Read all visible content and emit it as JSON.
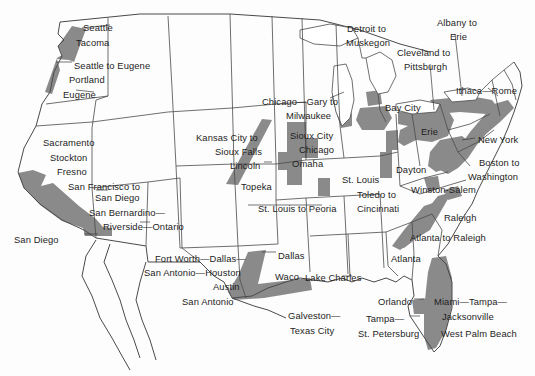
{
  "map": {
    "title": "United States megaregion corridors map",
    "colors": {
      "corridor_fill": "#8a8a8a",
      "state_border": "#4a4a4a",
      "background": "#fdfdfd",
      "label_text": "#1d1d1d"
    },
    "labels": [
      {
        "name": "label-seattle",
        "lines": [
          "Seattle"
        ],
        "x": 83,
        "y": 22,
        "align": "left"
      },
      {
        "name": "label-tacoma",
        "lines": [
          "Tacoma"
        ],
        "x": 76,
        "y": 37,
        "align": "left"
      },
      {
        "name": "label-seattle-to-eugene",
        "lines": [
          "Seattle to Eugene"
        ],
        "x": 74,
        "y": 60,
        "align": "left"
      },
      {
        "name": "label-portland",
        "lines": [
          "Portland"
        ],
        "x": 69,
        "y": 74,
        "align": "left"
      },
      {
        "name": "label-eugene",
        "lines": [
          "Eugene"
        ],
        "x": 63,
        "y": 89,
        "align": "left"
      },
      {
        "name": "label-sacramento",
        "lines": [
          "Sacramento"
        ],
        "x": 43,
        "y": 137,
        "align": "left"
      },
      {
        "name": "label-stockton",
        "lines": [
          "Stockton"
        ],
        "x": 50,
        "y": 152,
        "align": "left"
      },
      {
        "name": "label-fresno",
        "lines": [
          "Fresno"
        ],
        "x": 57,
        "y": 166,
        "align": "left"
      },
      {
        "name": "label-san-francisco-to-san-diego",
        "lines": [
          "San Francisco to"
        ],
        "x": 68,
        "y": 181,
        "align": "left"
      },
      {
        "name": "label-san-diego-corridor-end",
        "lines": [
          "San Diego"
        ],
        "x": 95,
        "y": 192,
        "align": "left"
      },
      {
        "name": "label-san-bernardino",
        "lines": [
          "San Bernardino—"
        ],
        "x": 89,
        "y": 207,
        "align": "left"
      },
      {
        "name": "label-riverside-ontario",
        "lines": [
          "Riverside—Ontario"
        ],
        "x": 103,
        "y": 221,
        "align": "left"
      },
      {
        "name": "label-san-diego",
        "lines": [
          "San Diego"
        ],
        "x": 14,
        "y": 234,
        "align": "left"
      },
      {
        "name": "label-kansas-city-to",
        "lines": [
          "Kansas City to"
        ],
        "x": 196,
        "y": 132,
        "align": "left"
      },
      {
        "name": "label-sioux-falls",
        "lines": [
          "Sioux Falls"
        ],
        "x": 215,
        "y": 146,
        "align": "left"
      },
      {
        "name": "label-lincoln",
        "lines": [
          "Lincoln"
        ],
        "x": 230,
        "y": 160,
        "align": "left"
      },
      {
        "name": "label-topeka",
        "lines": [
          "Topeka"
        ],
        "x": 241,
        "y": 181,
        "align": "left"
      },
      {
        "name": "label-chicago-gary-to",
        "lines": [
          "Chicago—Gary to"
        ],
        "x": 262,
        "y": 96,
        "align": "left"
      },
      {
        "name": "label-milwaukee",
        "lines": [
          "Milwaukee"
        ],
        "x": 286,
        "y": 110,
        "align": "left"
      },
      {
        "name": "label-sioux-city",
        "lines": [
          "Sioux City"
        ],
        "x": 290,
        "y": 130,
        "align": "left"
      },
      {
        "name": "label-chicago",
        "lines": [
          "Chicago"
        ],
        "x": 299,
        "y": 144,
        "align": "left"
      },
      {
        "name": "label-omaha",
        "lines": [
          "Omaha"
        ],
        "x": 292,
        "y": 158,
        "align": "left"
      },
      {
        "name": "label-st-louis",
        "lines": [
          "St. Louis"
        ],
        "x": 342,
        "y": 174,
        "align": "left"
      },
      {
        "name": "label-toledo-to",
        "lines": [
          "Toledo to"
        ],
        "x": 357,
        "y": 189,
        "align": "left"
      },
      {
        "name": "label-cincinnati",
        "lines": [
          "Cincinnati"
        ],
        "x": 357,
        "y": 203,
        "align": "left"
      },
      {
        "name": "label-st-louis-to-peoria",
        "lines": [
          "St. Louis to Peoria"
        ],
        "x": 258,
        "y": 203,
        "align": "left"
      },
      {
        "name": "label-detroit-to",
        "lines": [
          "Detroit to"
        ],
        "x": 347,
        "y": 23,
        "align": "left"
      },
      {
        "name": "label-muskegon",
        "lines": [
          "Muskegon"
        ],
        "x": 346,
        "y": 37,
        "align": "left"
      },
      {
        "name": "label-cleveland-to",
        "lines": [
          "Cleveland to"
        ],
        "x": 397,
        "y": 47,
        "align": "left"
      },
      {
        "name": "label-pittsburgh",
        "lines": [
          "Pittsburgh"
        ],
        "x": 404,
        "y": 61,
        "align": "left"
      },
      {
        "name": "label-albany-to",
        "lines": [
          "Albany to"
        ],
        "x": 437,
        "y": 17,
        "align": "left"
      },
      {
        "name": "label-erie-corridor-end",
        "lines": [
          "Erie"
        ],
        "x": 450,
        "y": 31,
        "align": "left"
      },
      {
        "name": "label-ithaca-rome",
        "lines": [
          "Ithaca—Rome"
        ],
        "x": 456,
        "y": 85,
        "align": "left"
      },
      {
        "name": "label-bay-city",
        "lines": [
          "Bay City"
        ],
        "x": 385,
        "y": 102,
        "align": "left"
      },
      {
        "name": "label-erie",
        "lines": [
          "Erie"
        ],
        "x": 421,
        "y": 126,
        "align": "left"
      },
      {
        "name": "label-new-york",
        "lines": [
          "New York"
        ],
        "x": 478,
        "y": 134,
        "align": "left"
      },
      {
        "name": "label-boston-to",
        "lines": [
          "Boston to"
        ],
        "x": 479,
        "y": 157,
        "align": "left"
      },
      {
        "name": "label-washington",
        "lines": [
          "Washington"
        ],
        "x": 468,
        "y": 171,
        "align": "left"
      },
      {
        "name": "label-dayton",
        "lines": [
          "Dayton"
        ],
        "x": 396,
        "y": 164,
        "align": "left"
      },
      {
        "name": "label-winston-salem",
        "lines": [
          "Winston-Salem"
        ],
        "x": 411,
        "y": 184,
        "align": "left"
      },
      {
        "name": "label-raleigh",
        "lines": [
          "Raleigh"
        ],
        "x": 444,
        "y": 212,
        "align": "left"
      },
      {
        "name": "label-atlanta-to-raleigh",
        "lines": [
          "Atlanta to Raleigh"
        ],
        "x": 410,
        "y": 232,
        "align": "left"
      },
      {
        "name": "label-atlanta",
        "lines": [
          "Atlanta"
        ],
        "x": 391,
        "y": 253,
        "align": "left"
      },
      {
        "name": "label-fort-worth-dallas",
        "lines": [
          "Fort Worth—Dallas—"
        ],
        "x": 155,
        "y": 253,
        "align": "left"
      },
      {
        "name": "label-san-antonio-houston",
        "lines": [
          "San Antonio—Houston"
        ],
        "x": 144,
        "y": 267,
        "align": "left"
      },
      {
        "name": "label-austin",
        "lines": [
          "Austin"
        ],
        "x": 213,
        "y": 281,
        "align": "left"
      },
      {
        "name": "label-san-antonio",
        "lines": [
          "San Antonio"
        ],
        "x": 182,
        "y": 296,
        "align": "left"
      },
      {
        "name": "label-dallas",
        "lines": [
          "Dallas"
        ],
        "x": 278,
        "y": 250,
        "align": "left"
      },
      {
        "name": "label-waco",
        "lines": [
          "Waco"
        ],
        "x": 275,
        "y": 271,
        "align": "left"
      },
      {
        "name": "label-lake-charles",
        "lines": [
          "Lake Charles"
        ],
        "x": 305,
        "y": 272,
        "align": "left"
      },
      {
        "name": "label-galveston",
        "lines": [
          "Galveston—"
        ],
        "x": 288,
        "y": 310,
        "align": "left"
      },
      {
        "name": "label-texas-city",
        "lines": [
          "Texas City"
        ],
        "x": 290,
        "y": 325,
        "align": "left"
      },
      {
        "name": "label-orlando",
        "lines": [
          "Orlando"
        ],
        "x": 378,
        "y": 296,
        "align": "left"
      },
      {
        "name": "label-tampa",
        "lines": [
          "Tampa—"
        ],
        "x": 366,
        "y": 313,
        "align": "left"
      },
      {
        "name": "label-st-petersburg",
        "lines": [
          "St. Petersburg"
        ],
        "x": 358,
        "y": 328,
        "align": "left"
      },
      {
        "name": "label-miami-tampa",
        "lines": [
          "Miami—Tampa—"
        ],
        "x": 434,
        "y": 296,
        "align": "left"
      },
      {
        "name": "label-jacksonville",
        "lines": [
          "Jacksonville"
        ],
        "x": 442,
        "y": 311,
        "align": "left"
      },
      {
        "name": "label-west-palm-beach",
        "lines": [
          "West Palm Beach"
        ],
        "x": 441,
        "y": 328,
        "align": "left"
      }
    ]
  }
}
